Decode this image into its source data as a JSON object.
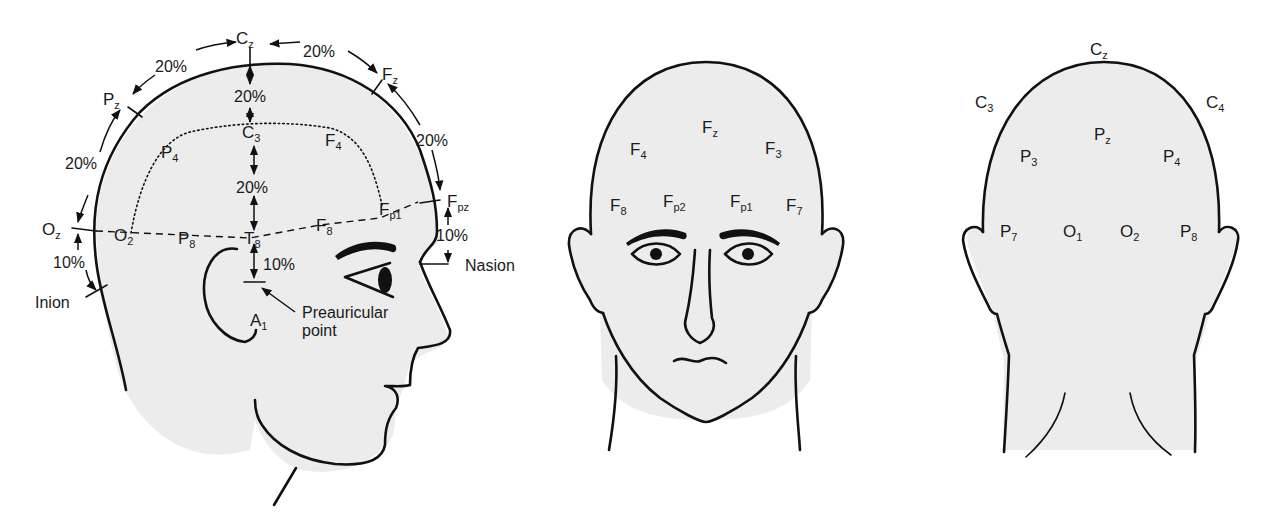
{
  "figure": {
    "views": [
      "side",
      "front",
      "back"
    ]
  },
  "side_view": {
    "midline_electrodes": [
      {
        "main": "C",
        "sub": "z"
      },
      {
        "main": "F",
        "sub": "z"
      },
      {
        "main": "F",
        "sub": "pz"
      },
      {
        "main": "P",
        "sub": "z"
      },
      {
        "main": "O",
        "sub": "z"
      }
    ],
    "lateral_electrodes": [
      {
        "main": "C",
        "sub": "3"
      },
      {
        "main": "F",
        "sub": "4"
      },
      {
        "main": "P",
        "sub": "4"
      },
      {
        "main": "F",
        "sub": "p1"
      },
      {
        "main": "F",
        "sub": "8"
      },
      {
        "main": "T",
        "sub": "8"
      },
      {
        "main": "P",
        "sub": "8"
      },
      {
        "main": "O",
        "sub": "2"
      },
      {
        "main": "A",
        "sub": "1"
      }
    ],
    "percentages": {
      "pz_cz": "20%",
      "cz_fz": "20%",
      "fz_fpz": "20%",
      "oz_pz": "20%",
      "cz_c3": "20%",
      "c3_t8": "20%",
      "t8_preauricular": "10%",
      "fpz_nasion": "10%",
      "oz_inion": "10%"
    },
    "landmarks": {
      "nasion": "Nasion",
      "inion": "Inion",
      "preauricular_line1": "Preauricular",
      "preauricular_line2": "point"
    }
  },
  "front_view": {
    "electrodes": [
      {
        "main": "F",
        "sub": "z"
      },
      {
        "main": "F",
        "sub": "4"
      },
      {
        "main": "F",
        "sub": "3"
      },
      {
        "main": "F",
        "sub": "8"
      },
      {
        "main": "F",
        "sub": "p2"
      },
      {
        "main": "F",
        "sub": "p1"
      },
      {
        "main": "F",
        "sub": "7"
      }
    ]
  },
  "back_view": {
    "electrodes": [
      {
        "main": "C",
        "sub": "z"
      },
      {
        "main": "C",
        "sub": "3"
      },
      {
        "main": "C",
        "sub": "4"
      },
      {
        "main": "P",
        "sub": "z"
      },
      {
        "main": "P",
        "sub": "3"
      },
      {
        "main": "P",
        "sub": "4"
      },
      {
        "main": "P",
        "sub": "7"
      },
      {
        "main": "O",
        "sub": "1"
      },
      {
        "main": "O",
        "sub": "2"
      },
      {
        "main": "P",
        "sub": "8"
      }
    ]
  },
  "colors": {
    "skin": "#ececec",
    "line": "#111111",
    "background": "#ffffff"
  }
}
